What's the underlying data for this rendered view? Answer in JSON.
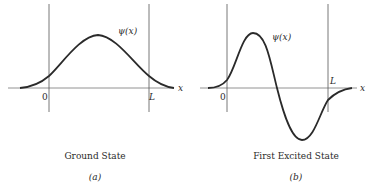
{
  "panels": [
    {
      "id": "a",
      "caption": "Ground State",
      "sublabel": "(a)",
      "function_label": "ψ(x)",
      "axis_label": "x",
      "origin_label": "0",
      "width_label": "L"
    },
    {
      "id": "b",
      "caption": "First Excited State",
      "sublabel": "(b)",
      "function_label": "ψ(x)",
      "axis_label": "x",
      "origin_label": "0",
      "width_label": "L"
    }
  ],
  "colors": {
    "line": "#2a2a2a",
    "wall": "#555555",
    "axis": "#777777"
  }
}
